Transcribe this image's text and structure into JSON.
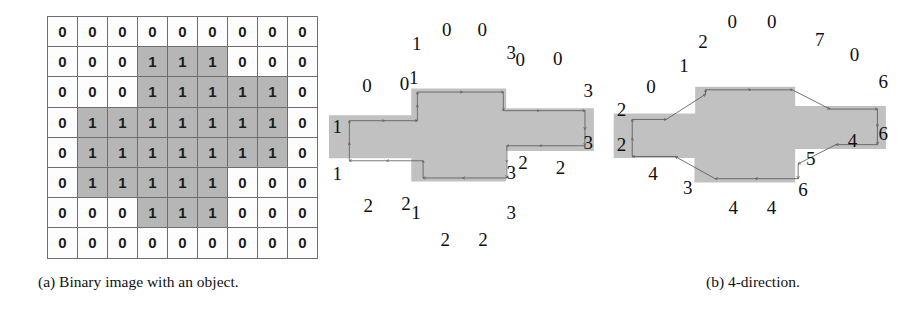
{
  "figure": {
    "colors": {
      "object_fill": "#c1c1c1",
      "grid_on_fill": "#b6b6b6",
      "grid_off_fill": "#fdfdfd",
      "grid_line": "#6e6e6e",
      "trace_stroke": "#555555",
      "text": "#111111"
    }
  },
  "panel_a": {
    "caption": "(a) Binary image with an object.",
    "grid": {
      "columns": 9,
      "rows": 8,
      "values": [
        [
          0,
          0,
          0,
          0,
          0,
          0,
          0,
          0,
          0
        ],
        [
          0,
          0,
          0,
          1,
          1,
          1,
          0,
          0,
          0
        ],
        [
          0,
          0,
          0,
          1,
          1,
          1,
          1,
          1,
          0
        ],
        [
          0,
          1,
          1,
          1,
          1,
          1,
          1,
          1,
          0
        ],
        [
          0,
          1,
          1,
          1,
          1,
          1,
          1,
          1,
          0
        ],
        [
          0,
          1,
          1,
          1,
          1,
          1,
          0,
          0,
          0
        ],
        [
          0,
          0,
          0,
          1,
          1,
          1,
          0,
          0,
          0
        ],
        [
          0,
          0,
          0,
          0,
          0,
          0,
          0,
          0,
          0
        ]
      ]
    }
  },
  "panel_b": {
    "caption": "(b) 4-direction.",
    "chain_code": [
      0,
      0,
      1,
      1,
      0,
      0,
      3,
      0,
      0,
      3,
      3,
      2,
      2,
      3,
      3,
      2,
      2,
      1,
      2,
      2,
      1,
      1
    ],
    "labels": [
      {
        "text": "0",
        "x": 131,
        "y": 94
      },
      {
        "text": "0",
        "x": 236,
        "y": 92
      },
      {
        "text": "1",
        "x": 262,
        "y": 85
      },
      {
        "text": "1",
        "x": 270,
        "y": 48
      },
      {
        "text": "0",
        "x": 354,
        "y": 32
      },
      {
        "text": "0",
        "x": 453,
        "y": 32
      },
      {
        "text": "3",
        "x": 534,
        "y": 58
      },
      {
        "text": "0",
        "x": 559,
        "y": 66
      },
      {
        "text": "0",
        "x": 664,
        "y": 64
      },
      {
        "text": "3",
        "x": 749,
        "y": 100
      },
      {
        "text": "3",
        "x": 749,
        "y": 158
      },
      {
        "text": "2",
        "x": 672,
        "y": 186
      },
      {
        "text": "2",
        "x": 567,
        "y": 180
      },
      {
        "text": "3",
        "x": 534,
        "y": 191
      },
      {
        "text": "3",
        "x": 534,
        "y": 235
      },
      {
        "text": "2",
        "x": 455,
        "y": 265
      },
      {
        "text": "2",
        "x": 350,
        "y": 265
      },
      {
        "text": "1",
        "x": 268,
        "y": 235
      },
      {
        "text": "2",
        "x": 240,
        "y": 226
      },
      {
        "text": "2",
        "x": 135,
        "y": 228
      },
      {
        "text": "1",
        "x": 48,
        "y": 192
      },
      {
        "text": "1",
        "x": 48,
        "y": 140
      }
    ]
  },
  "panel_c": {
    "caption": "(c) 8-direction.",
    "chain_code": [
      0,
      1,
      2,
      0,
      0,
      7,
      0,
      6,
      6,
      4,
      5,
      6,
      4,
      4,
      3,
      4,
      2,
      2
    ],
    "labels": [
      {
        "text": "0",
        "x": 111,
        "y": 96
      },
      {
        "text": "1",
        "x": 200,
        "y": 72
      },
      {
        "text": "2",
        "x": 251,
        "y": 46
      },
      {
        "text": "0",
        "x": 330,
        "y": 23
      },
      {
        "text": "0",
        "x": 437,
        "y": 23
      },
      {
        "text": "7",
        "x": 566,
        "y": 43
      },
      {
        "text": "0",
        "x": 660,
        "y": 60
      },
      {
        "text": "6",
        "x": 738,
        "y": 90
      },
      {
        "text": "6",
        "x": 738,
        "y": 148
      },
      {
        "text": "4",
        "x": 655,
        "y": 155
      },
      {
        "text": "5",
        "x": 542,
        "y": 175
      },
      {
        "text": "6",
        "x": 521,
        "y": 210
      },
      {
        "text": "4",
        "x": 436,
        "y": 230
      },
      {
        "text": "4",
        "x": 333,
        "y": 230
      },
      {
        "text": "3",
        "x": 210,
        "y": 208
      },
      {
        "text": "4",
        "x": 116,
        "y": 192
      },
      {
        "text": "2",
        "x": 31,
        "y": 160
      },
      {
        "text": "2",
        "x": 31,
        "y": 121
      }
    ]
  }
}
